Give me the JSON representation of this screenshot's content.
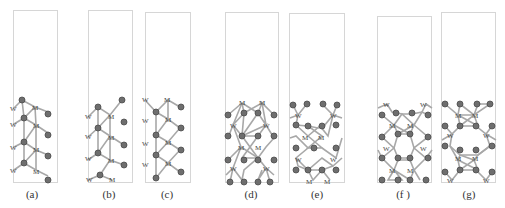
{
  "figure": {
    "atom_labels": {
      "tungsten": "W",
      "metal": "M",
      "oxygen": "O"
    },
    "colors": {
      "frame": "#d6d6d6",
      "bond": "#a8a8a8",
      "atom_o": "#6e6e6e",
      "atom_o_rim": "#4a4a4a",
      "atom_metal_text": "#444444",
      "label_text": "#333333"
    },
    "panels": [
      {
        "id": "a",
        "label": "(a)",
        "frame": {
          "x": 13,
          "y": 10,
          "w": 45,
          "h": 173
        }
      },
      {
        "id": "b",
        "label": "(b)",
        "frame": {
          "x": 88,
          "y": 10,
          "w": 45,
          "h": 173
        }
      },
      {
        "id": "c",
        "label": "(c)",
        "frame": {
          "x": 145,
          "y": 12,
          "w": 46,
          "h": 171
        }
      },
      {
        "id": "d",
        "label": "(d)",
        "frame": {
          "x": 225,
          "y": 12,
          "w": 54,
          "h": 171
        }
      },
      {
        "id": "e",
        "label": "(e)",
        "frame": {
          "x": 289,
          "y": 13,
          "w": 56,
          "h": 170
        }
      },
      {
        "id": "f",
        "label": "(f )",
        "frame": {
          "x": 377,
          "y": 16,
          "w": 55,
          "h": 167
        }
      },
      {
        "id": "g",
        "label": "(g)",
        "frame": {
          "x": 441,
          "y": 12,
          "w": 55,
          "h": 171
        }
      }
    ]
  }
}
